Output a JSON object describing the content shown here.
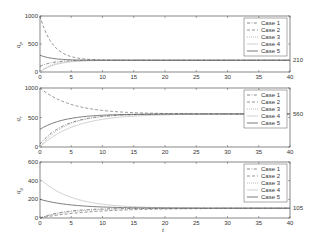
{
  "chart_data": [
    {
      "type": "line",
      "title": "",
      "xlabel": "",
      "ylabel": "q_p",
      "xlim": [
        0,
        40
      ],
      "ylim": [
        0,
        1000
      ],
      "xticks": [
        "0",
        "5",
        "10",
        "15",
        "20",
        "25",
        "30",
        "35",
        "40"
      ],
      "yticks": [
        "0",
        "500",
        "1000"
      ],
      "steady_state_label": "210",
      "legend": [
        "Case 1",
        "Case 2",
        "Case 3",
        "Case 4",
        "Case 5"
      ],
      "legend_position": "upper right",
      "series": [
        {
          "name": "Case 1",
          "style": "dash-dot",
          "start": 100,
          "end": 210,
          "tau": 2.0
        },
        {
          "name": "Case 2",
          "style": "dashed",
          "start": 1000,
          "end": 210,
          "tau": 2.0
        },
        {
          "name": "Case 3",
          "style": "dotted",
          "start": 0,
          "end": 210,
          "tau": 2.0
        },
        {
          "name": "Case 4",
          "style": "solid-light",
          "start": 0,
          "end": 210,
          "tau": 2.5
        },
        {
          "name": "Case 5",
          "style": "solid",
          "start": 300,
          "end": 210,
          "tau": 2.0
        }
      ]
    },
    {
      "type": "line",
      "title": "",
      "xlabel": "",
      "ylabel": "q_r",
      "xlim": [
        0,
        40
      ],
      "ylim": [
        0,
        1000
      ],
      "xticks": [
        "0",
        "5",
        "10",
        "15",
        "20",
        "25",
        "30",
        "35",
        "40"
      ],
      "yticks": [
        "0",
        "500",
        "1000"
      ],
      "steady_state_label": "560",
      "legend": [
        "Case 1",
        "Case 2",
        "Case 3",
        "Case 4",
        "Case 5"
      ],
      "legend_position": "upper right",
      "series": [
        {
          "name": "Case 1",
          "style": "dash-dot",
          "start": 50,
          "end": 560,
          "tau": 4.0
        },
        {
          "name": "Case 2",
          "style": "dashed",
          "start": 1000,
          "end": 560,
          "tau": 5.0
        },
        {
          "name": "Case 3",
          "style": "dotted",
          "start": 0,
          "end": 560,
          "tau": 4.0
        },
        {
          "name": "Case 4",
          "style": "solid-light",
          "start": 0,
          "end": 560,
          "tau": 5.5
        },
        {
          "name": "Case 5",
          "style": "solid",
          "start": 300,
          "end": 560,
          "tau": 4.0
        }
      ]
    },
    {
      "type": "line",
      "title": "",
      "xlabel": "t",
      "ylabel": "q_g",
      "xlim": [
        0,
        40
      ],
      "ylim": [
        0,
        600
      ],
      "xticks": [
        "0",
        "5",
        "10",
        "15",
        "20",
        "25",
        "30",
        "35",
        "40"
      ],
      "yticks": [
        "0",
        "200",
        "400",
        "600"
      ],
      "steady_state_label": "105",
      "legend": [
        "Case 1",
        "Case 2",
        "Case 3",
        "Case 4",
        "Case 5"
      ],
      "legend_position": "upper right",
      "series": [
        {
          "name": "Case 1",
          "style": "dash-dot",
          "start": 0,
          "end": 105,
          "tau": 4.0
        },
        {
          "name": "Case 2",
          "style": "dashed",
          "start": 0,
          "end": 105,
          "tau": 8.0
        },
        {
          "name": "Case 3",
          "style": "dotted",
          "start": 0,
          "end": 105,
          "tau": 5.0
        },
        {
          "name": "Case 4",
          "style": "solid-light",
          "start": 420,
          "end": 105,
          "tau": 5.0
        },
        {
          "name": "Case 5",
          "style": "solid",
          "start": 200,
          "end": 105,
          "tau": 5.0
        }
      ]
    }
  ],
  "panels": [
    {
      "ylabel": "q",
      "ysub": "p",
      "steady": "210",
      "yt": [
        "0",
        "500",
        "1000"
      ]
    },
    {
      "ylabel": "q",
      "ysub": "r",
      "steady": "560",
      "yt": [
        "0",
        "500",
        "1000"
      ]
    },
    {
      "ylabel": "q",
      "ysub": "g",
      "steady": "105",
      "yt": [
        "0",
        "200",
        "400",
        "600"
      ]
    }
  ],
  "xlabel": "t",
  "legend": [
    "Case 1",
    "Case 2",
    "Case 3",
    "Case 4",
    "Case 5"
  ]
}
